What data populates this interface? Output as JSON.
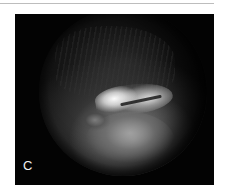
{
  "figure": {
    "panel_label": "C",
    "colors": {
      "background": "#030303",
      "label": "#f2f2f2",
      "page": "#ffffff",
      "rule": "#bdbdbd"
    }
  }
}
